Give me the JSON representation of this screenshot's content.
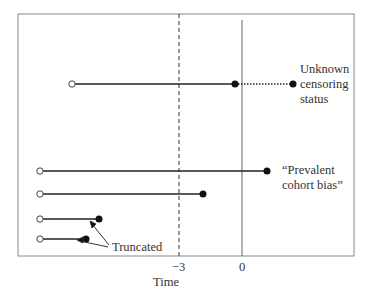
{
  "diagram": {
    "xlabel": "Time",
    "ticks": [
      {
        "label": "−3",
        "x": 179
      },
      {
        "label": "0",
        "x": 242
      }
    ],
    "lines": [
      {
        "start": 72,
        "end": 235,
        "y": 84,
        "dotted_to": 293
      },
      {
        "start": 40,
        "end": 267,
        "y": 171
      },
      {
        "start": 40,
        "end": 203,
        "y": 194
      },
      {
        "start": 40,
        "end": 99,
        "y": 219
      },
      {
        "start": 40,
        "end": 86,
        "y": 239
      }
    ],
    "annotations": {
      "unknown": [
        "Unknown",
        "censoring",
        "status"
      ],
      "prevalent": [
        "“Prevalent",
        "cohort bias”"
      ],
      "truncated": "Truncated"
    }
  }
}
